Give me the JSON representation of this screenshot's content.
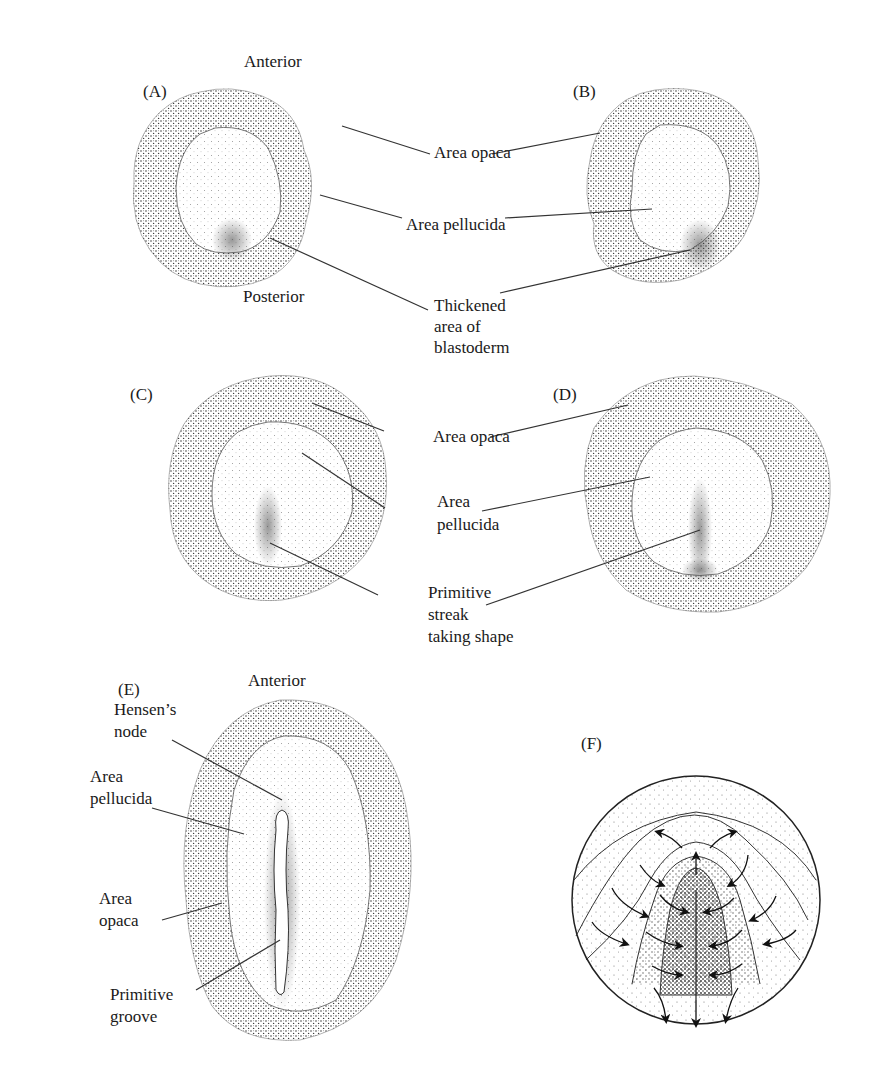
{
  "figure": {
    "panels": [
      {
        "id": "A",
        "letter": "(A)",
        "orientation_top": "Anterior",
        "orientation_bottom": "Posterior",
        "labels": [
          "Area opaca",
          "Area pellucida",
          "Thickened",
          "area of",
          "blastoderm"
        ]
      },
      {
        "id": "B",
        "letter": "(B)"
      },
      {
        "id": "C",
        "letter": "(C)",
        "labels": [
          "Area opaca",
          "Area",
          "pellucida",
          "Primitive",
          "streak",
          "taking shape"
        ]
      },
      {
        "id": "D",
        "letter": "(D)"
      },
      {
        "id": "E",
        "letter": "(E)",
        "orientation_top": "Anterior",
        "labels": [
          "Hensen’s",
          "node",
          "Area",
          "pellucida",
          "Area",
          "opaca",
          "Primitive",
          "groove"
        ]
      },
      {
        "id": "F",
        "letter": "(F)",
        "description": "Cell migration arrows converging toward the primitive streak"
      }
    ],
    "colors": {
      "ink": "#1a1a1a",
      "stipple_dark": "#3a3a3a",
      "stipple_light": "#8a8a8a",
      "background": "#ffffff"
    }
  }
}
